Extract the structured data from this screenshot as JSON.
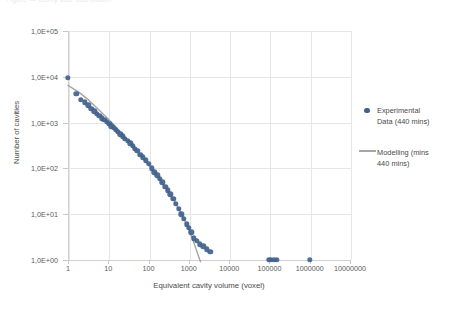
{
  "caption_remnant": "Figure — cavity size distribution",
  "chart_data": {
    "type": "scatter",
    "title": "",
    "xlabel": "Equivalent cavity volume (voxel)",
    "ylabel": "Number of cavities",
    "xscale": "log",
    "yscale": "log",
    "xlim": [
      1,
      10000000
    ],
    "ylim": [
      1,
      100000
    ],
    "grid": true,
    "legend_position": "right",
    "x_ticks": [
      "1",
      "10",
      "100",
      "1000",
      "10000",
      "100000",
      "1000000",
      "10000000"
    ],
    "x_tick_values": [
      1,
      10,
      100,
      1000,
      10000,
      100000,
      1000000,
      10000000
    ],
    "y_ticks": [
      "1,0E+00",
      "1,0E+01",
      "1,0E+02",
      "1,0E+03",
      "1,0E+04",
      "1,0E+05"
    ],
    "y_tick_values": [
      1,
      10,
      100,
      1000,
      10000,
      100000
    ],
    "series": [
      {
        "name": "Experimental Data (440 mins)",
        "type": "scatter",
        "color": "#41618c",
        "points": [
          [
            1.0,
            9500
          ],
          [
            1.6,
            4200
          ],
          [
            2.1,
            3100
          ],
          [
            2.6,
            2800
          ],
          [
            3.2,
            2400
          ],
          [
            3.8,
            2000
          ],
          [
            4.5,
            1750
          ],
          [
            5.2,
            1550
          ],
          [
            6.0,
            1400
          ],
          [
            7.0,
            1250
          ],
          [
            8.0,
            1150
          ],
          [
            9.2,
            1050
          ],
          [
            10.5,
            950
          ],
          [
            12.0,
            830
          ],
          [
            13.5,
            760
          ],
          [
            15.5,
            690
          ],
          [
            17.5,
            620
          ],
          [
            20.0,
            560
          ],
          [
            23.0,
            500
          ],
          [
            26.0,
            440
          ],
          [
            30.0,
            400
          ],
          [
            35.0,
            350
          ],
          [
            40.0,
            310
          ],
          [
            46.0,
            270
          ],
          [
            53.0,
            240
          ],
          [
            62.0,
            200
          ],
          [
            72.0,
            175
          ],
          [
            85.0,
            150
          ],
          [
            100.0,
            125
          ],
          [
            120.0,
            100
          ],
          [
            140.0,
            82
          ],
          [
            165.0,
            70
          ],
          [
            190.0,
            60
          ],
          [
            220.0,
            50
          ],
          [
            260.0,
            40
          ],
          [
            300.0,
            33
          ],
          [
            350.0,
            27
          ],
          [
            410.0,
            22
          ],
          [
            480.0,
            17
          ],
          [
            560.0,
            13
          ],
          [
            650.0,
            10
          ],
          [
            760.0,
            8
          ],
          [
            880.0,
            6
          ],
          [
            1000.0,
            5
          ],
          [
            1150.0,
            4
          ],
          [
            1350.0,
            3
          ],
          [
            1600.0,
            2.6
          ],
          [
            1900.0,
            2.2
          ],
          [
            2300.0,
            2.0
          ],
          [
            2800.0,
            1.7
          ],
          [
            3400.0,
            1.5
          ],
          [
            95000.0,
            1.0
          ],
          [
            110000.0,
            1.0
          ],
          [
            130000.0,
            1.0
          ],
          [
            150000.0,
            1.0
          ],
          [
            1000000.0,
            1.0
          ]
        ]
      },
      {
        "name": "Modelling (mins 440 mins)",
        "type": "line",
        "color": "#a6a6a6",
        "points": [
          [
            1.0,
            6500
          ],
          [
            1.5,
            5200
          ],
          [
            2.0,
            4400
          ],
          [
            3.0,
            3300
          ],
          [
            4.0,
            2600
          ],
          [
            6.0,
            1850
          ],
          [
            8.0,
            1450
          ],
          [
            10.0,
            1200
          ],
          [
            15.0,
            820
          ],
          [
            20.0,
            620
          ],
          [
            30.0,
            410
          ],
          [
            40.0,
            305
          ],
          [
            60.0,
            200
          ],
          [
            80.0,
            150
          ],
          [
            100.0,
            120
          ],
          [
            150.0,
            76
          ],
          [
            200.0,
            54
          ],
          [
            300.0,
            32
          ],
          [
            400.0,
            22
          ],
          [
            600.0,
            11.5
          ],
          [
            800.0,
            7.0
          ],
          [
            1000.0,
            4.6
          ],
          [
            1200.0,
            3.1
          ],
          [
            1400.0,
            2.1
          ],
          [
            1600.0,
            1.5
          ],
          [
            1800.0,
            1.1
          ],
          [
            1950.0,
            0.92
          ]
        ]
      }
    ],
    "legend": [
      {
        "label": "Experimental Data (440 mins)",
        "marker": "dot",
        "color": "#41618c"
      },
      {
        "label": "Modelling (mins 440 mins)",
        "marker": "line",
        "color": "#a6a6a6"
      }
    ]
  },
  "legend_display": {
    "experimental": "Experimental\nData (440 mins)",
    "modelling": "Modelling (mins\n440 mins)"
  }
}
